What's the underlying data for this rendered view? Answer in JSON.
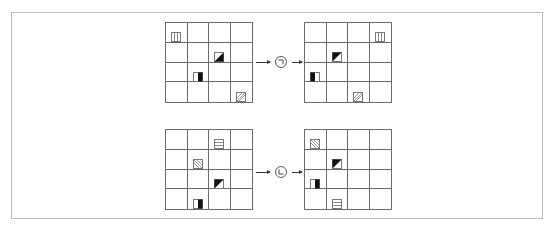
{
  "diagram": {
    "title": "",
    "colors": {
      "frame": "#bdbdbd",
      "grid_line": "#6b6b6b",
      "fill_dark": "#111111",
      "pattern": "#8a8a8a"
    },
    "rows": [
      {
        "operation": {
          "symbol": "rotate-clockwise-corner",
          "glyph": "¬",
          "label": ""
        },
        "input": {
          "pieces": [
            {
              "row": 0,
              "col": 0,
              "type": "vertical-stripes"
            },
            {
              "row": 1,
              "col": 2,
              "type": "triangle-bottom-right-dark"
            },
            {
              "row": 2,
              "col": 1,
              "type": "half-right-dark"
            },
            {
              "row": 3,
              "col": 3,
              "type": "diagonal-stripes"
            }
          ]
        },
        "output": {
          "pieces": [
            {
              "row": 0,
              "col": 3,
              "type": "vertical-stripes"
            },
            {
              "row": 1,
              "col": 1,
              "type": "triangle-top-left-dark"
            },
            {
              "row": 2,
              "col": 0,
              "type": "half-left-dark"
            },
            {
              "row": 3,
              "col": 2,
              "type": "diagonal-stripes"
            }
          ]
        }
      },
      {
        "operation": {
          "symbol": "rotate-corner-L",
          "glyph": "L",
          "label": ""
        },
        "input": {
          "pieces": [
            {
              "row": 0,
              "col": 2,
              "type": "horizontal-stripes"
            },
            {
              "row": 1,
              "col": 1,
              "type": "diagonal-stripes-reverse"
            },
            {
              "row": 2,
              "col": 2,
              "type": "triangle-top-left-dark"
            },
            {
              "row": 3,
              "col": 1,
              "type": "half-right-dark"
            }
          ]
        },
        "output": {
          "pieces": [
            {
              "row": 0,
              "col": 0,
              "type": "diagonal-stripes-reverse"
            },
            {
              "row": 1,
              "col": 1,
              "type": "triangle-top-left-dark"
            },
            {
              "row": 2,
              "col": 0,
              "type": "half-right-dark"
            },
            {
              "row": 3,
              "col": 1,
              "type": "horizontal-stripes"
            }
          ]
        }
      }
    ]
  }
}
